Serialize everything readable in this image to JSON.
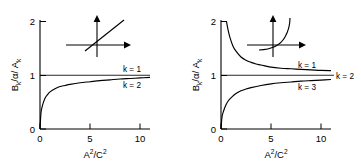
{
  "figure": {
    "panels": [
      {
        "id": "left",
        "xlabel_main": "A",
        "xlabel_sup": "2",
        "xlabel_div": "/C",
        "xlabel_sup2": "2",
        "ylabel_b": "B",
        "ylabel_bsub": "k",
        "ylabel_alpha": "/α",
        "ylabel_a": "/ A",
        "ylabel_asub": "k",
        "xticks": [
          "0",
          "5",
          "10"
        ],
        "yticks": [
          "0",
          "1",
          "2"
        ],
        "curve_labels": [
          "k = 1",
          "k = 2"
        ]
      },
      {
        "id": "right",
        "xlabel_main": "A",
        "xlabel_sup": "2",
        "xlabel_div": "/C",
        "xlabel_sup2": "2",
        "ylabel_b": "B",
        "ylabel_bsub": "k",
        "ylabel_alpha": "/α",
        "ylabel_a": "/ A",
        "ylabel_asub": "k",
        "xticks": [
          "0",
          "5",
          "10"
        ],
        "yticks": [
          "0",
          "1",
          "2"
        ],
        "curve_labels": [
          "k = 1",
          "k = 2",
          "k = 3"
        ]
      }
    ]
  },
  "chart_data": [
    {
      "type": "line",
      "panel": "left",
      "title": "",
      "xlabel": "A^2/C^2",
      "ylabel": "B_k/α / A_k",
      "xlim": [
        0,
        11
      ],
      "ylim": [
        0,
        2
      ],
      "xticks": [
        0,
        5,
        10
      ],
      "yticks": [
        0,
        1,
        2
      ],
      "grid": false,
      "legend": "inline-right",
      "inset": {
        "type": "schematic-axes",
        "curve": "straight-line-through-origin",
        "arrows": [
          "up",
          "right"
        ]
      },
      "series": [
        {
          "name": "k = 1",
          "label_x": 8.5,
          "label_y": 1.14,
          "x": [
            0,
            1,
            2,
            3,
            4,
            5,
            6,
            7,
            8,
            9,
            10,
            11
          ],
          "values": [
            1,
            1,
            1,
            1,
            1,
            1,
            1,
            1,
            1,
            1,
            1,
            1
          ]
        },
        {
          "name": "k = 2",
          "label_x": 8.5,
          "label_y": 0.8,
          "x": [
            0,
            0.1,
            0.25,
            0.5,
            0.75,
            1,
            1.5,
            2,
            2.5,
            3,
            4,
            5,
            6,
            7,
            8,
            9,
            10,
            11
          ],
          "values": [
            0,
            0.3,
            0.44,
            0.57,
            0.64,
            0.69,
            0.75,
            0.79,
            0.81,
            0.83,
            0.86,
            0.88,
            0.9,
            0.915,
            0.93,
            0.94,
            0.95,
            0.96
          ]
        }
      ]
    },
    {
      "type": "line",
      "panel": "right",
      "title": "",
      "xlabel": "A^2/C^2",
      "ylabel": "B_k/α / A_k",
      "xlim": [
        0,
        11
      ],
      "ylim": [
        0,
        2
      ],
      "xticks": [
        0,
        5,
        10
      ],
      "yticks": [
        0,
        1,
        2
      ],
      "grid": false,
      "legend": "inline-right",
      "inset": {
        "type": "schematic-axes",
        "curve": "exponential-rising",
        "arrows": [
          "up",
          "right"
        ]
      },
      "series": [
        {
          "name": "k = 1",
          "label_x": 8.3,
          "label_y": 1.23,
          "x": [
            0.55,
            0.7,
            0.9,
            1.2,
            1.5,
            2,
            2.5,
            3,
            3.5,
            4,
            5,
            6,
            7,
            8,
            9,
            10,
            11
          ],
          "values": [
            2.0,
            1.85,
            1.7,
            1.54,
            1.45,
            1.34,
            1.28,
            1.24,
            1.21,
            1.19,
            1.15,
            1.13,
            1.12,
            1.11,
            1.1,
            1.09,
            1.085
          ]
        },
        {
          "name": "k = 2",
          "label_x": 11.6,
          "label_y": 1.0,
          "x": [
            0,
            1,
            2,
            3,
            4,
            5,
            6,
            7,
            8,
            9,
            10,
            11
          ],
          "values": [
            1,
            1,
            1,
            1,
            1,
            1,
            1,
            1,
            1,
            1,
            1,
            1
          ]
        },
        {
          "name": "k = 3",
          "label_x": 8.3,
          "label_y": 0.78,
          "x": [
            0,
            0.1,
            0.25,
            0.5,
            0.75,
            1,
            1.5,
            2,
            2.5,
            3,
            4,
            5,
            6,
            7,
            8,
            9,
            10,
            11
          ],
          "values": [
            0,
            0.22,
            0.33,
            0.45,
            0.53,
            0.58,
            0.66,
            0.71,
            0.745,
            0.77,
            0.81,
            0.84,
            0.86,
            0.875,
            0.89,
            0.9,
            0.91,
            0.92
          ]
        }
      ]
    }
  ]
}
